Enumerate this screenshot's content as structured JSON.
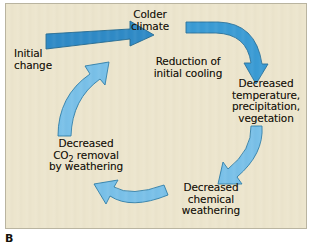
{
  "figure": {
    "caption_label": "B",
    "panel_background": "#ece5cd",
    "panel_border": "#b9b4a0",
    "text_color": "#141008"
  },
  "diagram": {
    "type": "feedback-cycle",
    "direction": "clockwise",
    "colors": {
      "entry_arrow": "#2f8ac6",
      "top_arrow": "#3a9bd4",
      "cycle_arrow": "#79c0e8",
      "arrow_outline": "#2d6f9e"
    },
    "nodes": [
      {
        "id": "initial-change",
        "label": "Initial\nchange",
        "role": "input"
      },
      {
        "id": "colder-climate",
        "label": "Colder\nclimate",
        "role": "cycle-node"
      },
      {
        "id": "decreased-temperature",
        "label": "Decreased\ntemperature,\nprecipitation,\nvegetation",
        "role": "cycle-node"
      },
      {
        "id": "decreased-chemical-weathering",
        "label": "Decreased\nchemical\nweathering",
        "role": "cycle-node"
      },
      {
        "id": "decreased-co2-removal",
        "label_part1": "Decreased",
        "label_part2": "CO",
        "label_subscript": "2",
        "label_part3": " removal",
        "label_part4": "by weathering",
        "role": "cycle-node"
      },
      {
        "id": "reduction-initial-cooling",
        "label": "Reduction of\ninitial cooling",
        "role": "cycle-node"
      }
    ],
    "arrows": [
      {
        "id": "arrow-initial-to-colder",
        "from": "initial-change",
        "to": "colder-climate",
        "shape": "straight-right"
      },
      {
        "id": "arrow-colder-to-temperature",
        "from": "colder-climate",
        "to": "decreased-temperature",
        "shape": "curve-right-down"
      },
      {
        "id": "arrow-temperature-to-chemical",
        "from": "decreased-temperature",
        "to": "decreased-chemical-weathering",
        "shape": "curve-down-left"
      },
      {
        "id": "arrow-chemical-to-co2",
        "from": "decreased-chemical-weathering",
        "to": "decreased-co2-removal",
        "shape": "curve-left-up"
      },
      {
        "id": "arrow-co2-to-reduction",
        "from": "decreased-co2-removal",
        "to": "reduction-initial-cooling",
        "shape": "curve-up-right"
      }
    ]
  }
}
